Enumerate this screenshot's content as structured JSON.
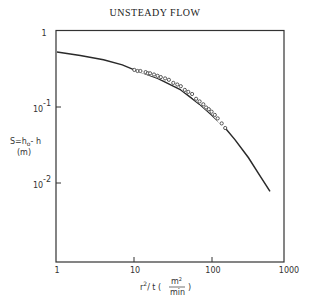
{
  "chart_data": {
    "type": "line",
    "title": "UNSTEADY FLOW",
    "xlabel": "r^2/t (m^2/min)",
    "ylabel": "S=h0-h (m)",
    "xscale": "log",
    "yscale": "log",
    "xlim": [
      1,
      1000
    ],
    "ylim": [
      0.001,
      1
    ],
    "x_ticks": [
      "1",
      "10",
      "100",
      "1000"
    ],
    "y_ticks": [
      "1",
      "10^-1",
      "10^-2"
    ],
    "grid": false,
    "legend": null,
    "series": [
      {
        "name": "theoretical curve",
        "style": "solid line",
        "x": [
          1,
          2,
          4,
          7,
          10,
          20,
          40,
          70,
          100,
          150,
          200,
          300,
          400,
          570
        ],
        "y": [
          0.53,
          0.48,
          0.42,
          0.36,
          0.31,
          0.24,
          0.17,
          0.11,
          0.08,
          0.054,
          0.038,
          0.022,
          0.014,
          0.008
        ]
      },
      {
        "name": "observed data",
        "style": "open circles",
        "x": [
          10,
          11,
          12,
          14,
          15,
          16,
          18,
          20,
          22,
          25,
          28,
          32,
          36,
          40,
          45,
          50,
          56,
          63,
          70,
          78,
          85,
          92,
          100,
          110,
          120,
          135,
          150
        ],
        "y": [
          0.31,
          0.3,
          0.3,
          0.29,
          0.28,
          0.28,
          0.27,
          0.26,
          0.25,
          0.24,
          0.23,
          0.21,
          0.2,
          0.19,
          0.17,
          0.16,
          0.15,
          0.13,
          0.12,
          0.11,
          0.1,
          0.095,
          0.088,
          0.08,
          0.072,
          0.062,
          0.054
        ]
      }
    ]
  },
  "labels": {
    "title": "UNSTEADY FLOW",
    "y_axis_line1": "S=h",
    "y_axis_sub": "o",
    "y_axis_rest": "- h",
    "y_axis_line2": "(m)",
    "x_axis_main": "r",
    "x_axis_sup": "2",
    "x_axis_rest": "/ t  (",
    "x_unit_num": "m",
    "x_unit_num_sup": "2",
    "x_unit_den": "min",
    "x_close": ")",
    "xt": [
      "1",
      "10",
      "100",
      "1000"
    ],
    "yt_1": "1",
    "yt_2_base": "10",
    "yt_2_exp": "-1",
    "yt_3_base": "10",
    "yt_3_exp": "-2"
  }
}
